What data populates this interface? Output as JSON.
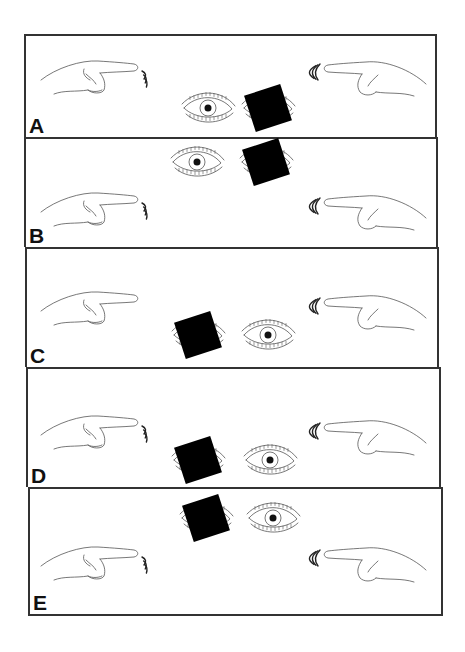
{
  "figure": {
    "type": "diagram",
    "colors": {
      "line": "#555555",
      "border": "#333333",
      "occluder": "#000000",
      "label": "#111111"
    },
    "panels": [
      {
        "label": "A",
        "top": 34,
        "height": 103,
        "left_hand": {
          "y": 66,
          "rubbing": true
        },
        "right_hand": {
          "y": 66,
          "rubbing": true
        },
        "eyes_row_y": 108,
        "occluded_eye": "right",
        "left_eye_x": 208,
        "right_eye_x": 268
      },
      {
        "label": "B",
        "top": 137,
        "height": 110,
        "left_hand": {
          "y": 198,
          "rubbing": true
        },
        "right_hand": {
          "y": 200,
          "rubbing": true
        },
        "eyes_row_y": 162,
        "occluded_eye": "right",
        "left_eye_x": 197,
        "right_eye_x": 266
      },
      {
        "label": "C",
        "top": 247,
        "height": 120,
        "left_hand": {
          "y": 297,
          "rubbing": false
        },
        "right_hand": {
          "y": 300,
          "rubbing": true
        },
        "eyes_row_y": 335,
        "occluded_eye": "left",
        "left_eye_x": 198,
        "right_eye_x": 268
      },
      {
        "label": "D",
        "top": 367,
        "height": 120,
        "left_hand": {
          "y": 421,
          "rubbing": true
        },
        "right_hand": {
          "y": 425,
          "rubbing": true
        },
        "eyes_row_y": 460,
        "occluded_eye": "left",
        "left_eye_x": 198,
        "right_eye_x": 270
      },
      {
        "label": "E",
        "top": 487,
        "height": 128,
        "left_hand": {
          "y": 552,
          "rubbing": true
        },
        "right_hand": {
          "y": 552,
          "rubbing": true
        },
        "eyes_row_y": 518,
        "occluded_eye": "left",
        "left_eye_x": 206,
        "right_eye_x": 273
      }
    ]
  }
}
